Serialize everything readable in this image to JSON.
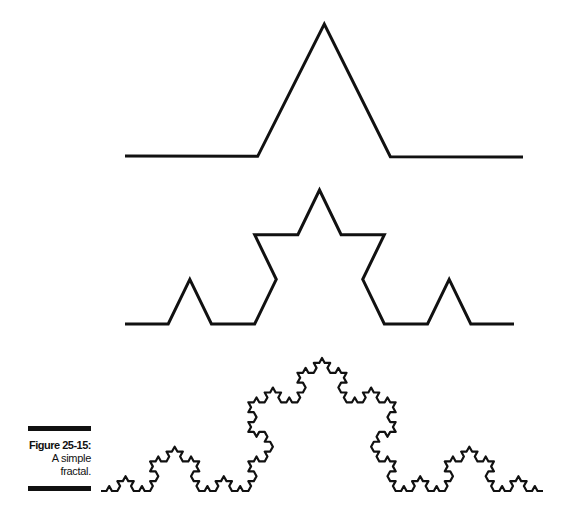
{
  "figure": {
    "label": "Figure 25-15:",
    "caption_line1": "A simple",
    "caption_line2": "fractal.",
    "stroke_color": "#111111"
  },
  "curves": [
    {
      "name": "koch-level-1",
      "level": 1,
      "start": [
        125,
        156
      ],
      "end": [
        523,
        157
      ],
      "peak": [
        320,
        24
      ]
    },
    {
      "name": "koch-level-2",
      "level": 2,
      "start": [
        125,
        324
      ],
      "end": [
        514,
        324
      ],
      "peak": [
        320,
        190
      ]
    },
    {
      "name": "koch-level-4",
      "level": 4,
      "start": [
        101,
        491
      ],
      "end": [
        543,
        491
      ],
      "peak": [
        318,
        358
      ]
    }
  ]
}
